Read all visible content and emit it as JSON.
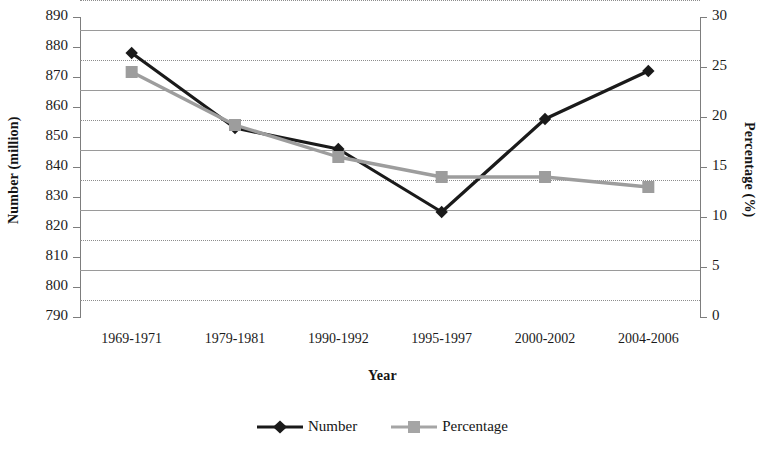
{
  "chart_data": {
    "type": "line",
    "title": "",
    "xlabel": "Year",
    "ylabel": "Number (million)",
    "y2label": "Percentage (%)",
    "categories": [
      "1969-1971",
      "1979-1981",
      "1990-1992",
      "1995-1997",
      "2000-2002",
      "2004-2006"
    ],
    "series": [
      {
        "name": "Number",
        "axis": "left",
        "color": "#1a1a1a",
        "marker": "diamond",
        "values": [
          878,
          853,
          846,
          825,
          856,
          872
        ]
      },
      {
        "name": "Percentage",
        "axis": "right",
        "color": "#9d9d9d",
        "marker": "square",
        "values": [
          24.5,
          19.2,
          16.0,
          14.0,
          14.0,
          13.0
        ]
      }
    ],
    "ylim": [
      790,
      890
    ],
    "ytick_step": 10,
    "yticks": [
      "890",
      "880",
      "870",
      "860",
      "850",
      "840",
      "830",
      "820",
      "810",
      "800",
      "790"
    ],
    "y2lim": [
      0,
      30
    ],
    "y2tick_step": 5,
    "y2ticks": [
      "30",
      "25",
      "20",
      "15",
      "10",
      "5",
      "0"
    ],
    "grid": true,
    "legend_position": "bottom"
  },
  "legend": {
    "items": [
      {
        "label": "Number",
        "color": "#1a1a1a",
        "marker": "diamond"
      },
      {
        "label": "Percentage",
        "color": "#9d9d9d",
        "marker": "square"
      }
    ]
  }
}
